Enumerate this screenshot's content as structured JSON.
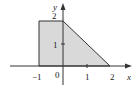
{
  "figure": {
    "x_axis_label": "x",
    "y_axis_label": "y",
    "origin_label": "0",
    "x_ticks": [
      {
        "value": -1,
        "label": "−1"
      },
      {
        "value": 1,
        "label": "1"
      },
      {
        "value": 2,
        "label": "2"
      }
    ],
    "y_ticks": [
      {
        "value": 1,
        "label": "1"
      },
      {
        "value": 2,
        "label": "2"
      }
    ],
    "region": {
      "description": "Shaded region bounded by x = -1, y = 2, the line y = 2 - x, and the x-axis",
      "vertices": [
        [
          -1,
          0
        ],
        [
          -1,
          2
        ],
        [
          0,
          2
        ],
        [
          2,
          0
        ]
      ],
      "fill_color": "#d9d9d9",
      "stroke_color": "#333333"
    },
    "axis_color": "#333333"
  }
}
